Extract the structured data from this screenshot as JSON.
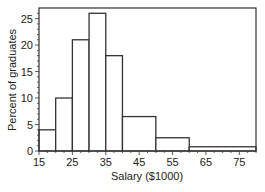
{
  "chart_data": {
    "type": "bar",
    "subtype": "histogram",
    "title": "",
    "xlabel": "Salary ($1000)",
    "ylabel": "Percent of graduates",
    "bins": [
      {
        "start": 15,
        "end": 20,
        "value": 4
      },
      {
        "start": 20,
        "end": 25,
        "value": 10
      },
      {
        "start": 25,
        "end": 30,
        "value": 21
      },
      {
        "start": 30,
        "end": 35,
        "value": 26
      },
      {
        "start": 35,
        "end": 40,
        "value": 18
      },
      {
        "start": 40,
        "end": 50,
        "value": 6.5
      },
      {
        "start": 50,
        "end": 60,
        "value": 2.5
      },
      {
        "start": 60,
        "end": 80,
        "value": 0.8
      }
    ],
    "categories": [
      "15-20",
      "20-25",
      "25-30",
      "30-35",
      "35-40",
      "40-50",
      "50-60",
      "60-80"
    ],
    "values": [
      4,
      10,
      21,
      26,
      18,
      6.5,
      2.5,
      0.8
    ],
    "xlim": [
      15,
      80
    ],
    "ylim": [
      0,
      27
    ],
    "xticks": [
      15,
      25,
      35,
      45,
      55,
      65,
      75
    ],
    "yticks": [
      0,
      5,
      10,
      15,
      20,
      25
    ],
    "grid": false,
    "legend": null
  }
}
